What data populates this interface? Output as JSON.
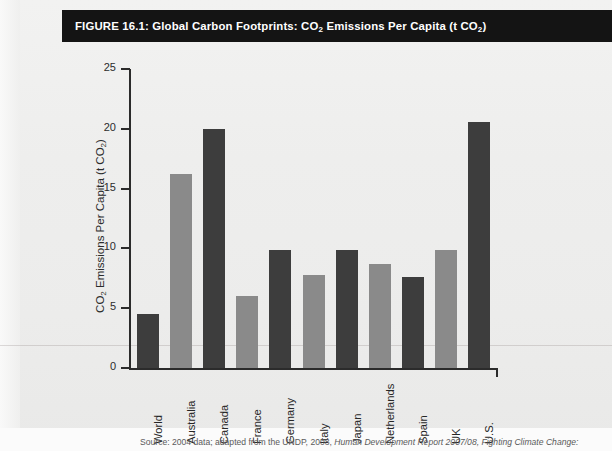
{
  "figure": {
    "title_prefix": "FIGURE 16.1: Global Carbon Footprints: CO",
    "title_sub1": "2",
    "title_mid": " Emissions Per Capita (t CO",
    "title_sub2": "2",
    "title_suffix": ")",
    "title_plain": "FIGURE 16.1: Global Carbon Footprints: CO2 Emissions Per Capita (t CO2)"
  },
  "axis": {
    "y_title_prefix": "CO",
    "y_title_sub1": "2",
    "y_title_mid": " Emissions Per Capita (t CO",
    "y_title_sub2": "2",
    "y_title_suffix": ")",
    "y_title_plain": "CO2 Emissions Per Capita (t CO2)",
    "ticks": [
      "25",
      "20",
      "15",
      "10",
      "5",
      "0"
    ]
  },
  "source": {
    "text_lead": "Source: 2004 data; adapted from the UNDP, 2008, ",
    "text_italic": "Human Development Report 2007/08, Fighting Climate Change:",
    "text_full": "Source: 2004 data; adapted from the UNDP, 2008, Human Development Report 2007/08, Fighting Climate Change:"
  },
  "colors": {
    "bar_dark": "#3d3d3d",
    "bar_light": "#8a8a8a",
    "title_bg": "#141414",
    "title_fg": "#ffffff",
    "axis": "#2b2b2b",
    "page_bg": "#ededec"
  },
  "chart_data": {
    "type": "bar",
    "title": "FIGURE 16.1: Global Carbon Footprints: CO2 Emissions Per Capita (t CO2)",
    "xlabel": "",
    "ylabel": "CO2 Emissions Per Capita (t CO2)",
    "ylim": [
      0,
      25
    ],
    "yticks": [
      0,
      5,
      10,
      15,
      20,
      25
    ],
    "grid": false,
    "legend": false,
    "categories": [
      "World",
      "Australia",
      "Canada",
      "France",
      "Germany",
      "Italy",
      "Japan",
      "Netherlands",
      "Spain",
      "UK",
      "U.S."
    ],
    "values": [
      4.5,
      16.2,
      20.0,
      6.0,
      9.9,
      7.8,
      9.9,
      8.7,
      7.6,
      9.9,
      20.6
    ],
    "bar_colors": [
      "#3d3d3d",
      "#8a8a8a",
      "#3d3d3d",
      "#8a8a8a",
      "#3d3d3d",
      "#8a8a8a",
      "#3d3d3d",
      "#8a8a8a",
      "#3d3d3d",
      "#8a8a8a",
      "#3d3d3d"
    ]
  }
}
